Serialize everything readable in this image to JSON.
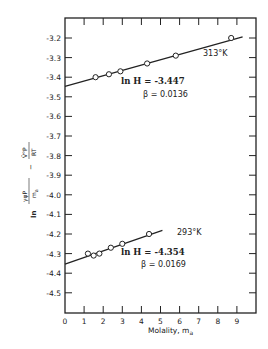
{
  "chart_data": {
    "type": "scatter",
    "title": "",
    "xlabel": "Molality, m_a",
    "ylabel": "ln[γφP/m_a] − V̄°P/RT",
    "xlim": [
      0,
      10
    ],
    "ylim": [
      -4.6,
      -3.1
    ],
    "x_ticks": [
      0,
      1,
      2,
      3,
      4,
      5,
      6,
      7,
      8,
      9
    ],
    "y_ticks": [
      -3.2,
      -3.3,
      -3.4,
      -3.5,
      -3.6,
      -3.7,
      -3.8,
      -3.9,
      -4.0,
      -4.1,
      -4.2,
      -4.3,
      -4.4,
      -4.5
    ],
    "y_tick_labels": [
      "-3.2",
      "-3.3",
      "-3.4",
      "-3.5",
      "-3.6",
      "-3.7",
      "-3.8",
      "-3.9",
      "-4.0",
      "-4.1",
      "-4.2",
      "-4.3",
      "-4.4",
      "-4.5"
    ],
    "grid": false,
    "series": [
      {
        "name": "313°K",
        "x": [
          1.6,
          2.3,
          2.9,
          4.3,
          5.8,
          8.7
        ],
        "y": [
          -3.4,
          -3.385,
          -3.37,
          -3.33,
          -3.29,
          -3.2
        ],
        "fit": {
          "intercept": -3.447,
          "slope": 0.0272,
          "x_range": [
            0,
            9.3
          ]
        },
        "annotation": {
          "lnH": "ln H = -3.447",
          "beta": "β = 0.0136"
        }
      },
      {
        "name": "293°K",
        "x": [
          1.2,
          1.5,
          1.8,
          2.4,
          3.0,
          4.4
        ],
        "y": [
          -4.3,
          -4.31,
          -4.3,
          -4.27,
          -4.25,
          -4.2
        ],
        "fit": {
          "intercept": -4.354,
          "slope": 0.0338,
          "x_range": [
            0,
            5.1
          ]
        },
        "annotation": {
          "lnH": "ln H = -4.354",
          "beta": "β = 0.0169"
        }
      }
    ]
  },
  "labels": {
    "series_313": "313°K",
    "lnH_313": "ln H = -3.447",
    "beta_313": "β = 0.0136",
    "series_293": "293°K",
    "lnH_293": "ln H = -4.354",
    "beta_293": "β = 0.0169",
    "xlabel": "Molality, m",
    "xlabel_sub": "a",
    "ylabel_ln": "ln",
    "ylabel_num": "γφP",
    "ylabel_den": "m",
    "ylabel_den_sub": "a",
    "ylabel_minus": "−",
    "ylabel_num2": "V̄°P",
    "ylabel_den2": "RT"
  }
}
